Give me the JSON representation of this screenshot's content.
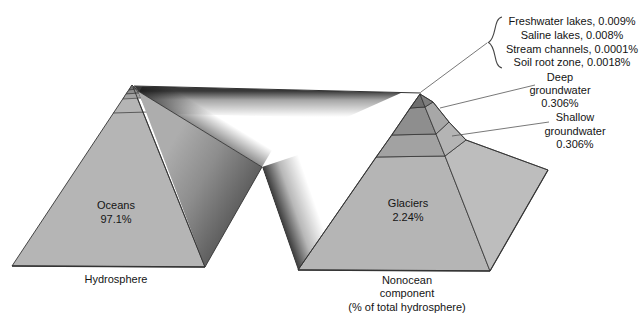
{
  "labels": {
    "tip_items": {
      "freshwater": "Freshwater lakes, 0.009%",
      "saline": "Saline lakes, 0.008%",
      "stream": "Stream channels, 0.0001%",
      "soil": "Soil root zone, 0.0018%"
    },
    "deep_groundwater": {
      "l1": "Deep",
      "l2": "groundwater",
      "l3": "0.306%"
    },
    "shallow_groundwater": {
      "l1": "Shallow",
      "l2": "groundwater",
      "l3": "0.306%"
    },
    "oceans": {
      "name": "Oceans",
      "value": "97.1%"
    },
    "glaciers": {
      "name": "Glaciers",
      "value": "2.24%"
    },
    "left_caption": "Hydrosphere",
    "right_caption": {
      "l1": "Nonocean",
      "l2": "component",
      "l3": "(% of total hydrosphere)"
    }
  },
  "colors": {
    "background": "#ffffff",
    "face": "#b5b5b5",
    "side": "#bdbdbd",
    "shallow_front": "#a2a2a2",
    "shallow_side": "#b4b4b4",
    "deep_front": "#8e8e8e",
    "deep_side": "#a7a7a7",
    "tip_front": "#6f6f6f",
    "tip_side": "#7e7e7e",
    "outline": "#333333",
    "text": "#141414"
  }
}
